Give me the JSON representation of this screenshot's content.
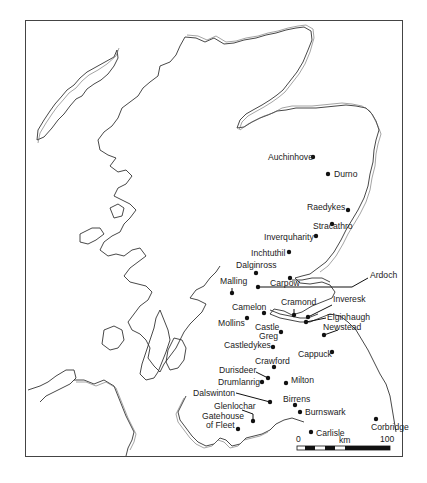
{
  "map": {
    "title": "",
    "region": "Scotland and northern England",
    "sites": [
      {
        "name": "Auchinhove",
        "x": 313,
        "y": 157,
        "lx": 268,
        "ly": 160,
        "anchor": "start"
      },
      {
        "name": "Durno",
        "x": 328,
        "y": 174,
        "lx": 334,
        "ly": 177,
        "anchor": "start"
      },
      {
        "name": "Raedykes",
        "x": 348,
        "y": 210,
        "lx": 307,
        "ly": 210,
        "anchor": "start"
      },
      {
        "name": "Stracathro",
        "x": 332,
        "y": 224,
        "lx": 313,
        "ly": 229,
        "anchor": "start"
      },
      {
        "name": "Inverquharity",
        "x": 316,
        "y": 236,
        "lx": 264,
        "ly": 240,
        "anchor": "start"
      },
      {
        "name": "Inchtuthil",
        "x": 289,
        "y": 252,
        "lx": 251,
        "ly": 256,
        "anchor": "start"
      },
      {
        "name": "Dalginross",
        "x": 256,
        "y": 273,
        "lx": 236,
        "ly": 268,
        "anchor": "start"
      },
      {
        "name": "Carpow",
        "x": 290,
        "y": 278,
        "lx": 270,
        "ly": 286,
        "anchor": "start"
      },
      {
        "name": "Malling",
        "x": 232,
        "y": 293,
        "lx": 220,
        "ly": 284,
        "anchor": "start"
      },
      {
        "name": "Ardoch",
        "x": 258,
        "y": 287,
        "lx": 370,
        "ly": 278,
        "anchor": "start"
      },
      {
        "name": "Cramond",
        "x": 294,
        "y": 315,
        "lx": 281,
        "ly": 305,
        "anchor": "start"
      },
      {
        "name": "Inveresk",
        "x": 308,
        "y": 317,
        "lx": 333,
        "ly": 302,
        "anchor": "start"
      },
      {
        "name": "Camelon",
        "x": 264,
        "y": 313,
        "lx": 232,
        "ly": 310,
        "anchor": "start"
      },
      {
        "name": "Elginhaugh",
        "x": 306,
        "y": 322,
        "lx": 327,
        "ly": 320,
        "anchor": "start"
      },
      {
        "name": "Mollins",
        "x": 247,
        "y": 318,
        "lx": 218,
        "ly": 326,
        "anchor": "start"
      },
      {
        "name": "Newstead",
        "x": 324,
        "y": 335,
        "lx": 323,
        "ly": 330,
        "anchor": "start"
      },
      {
        "name": "Castle Greg",
        "x": 281,
        "y": 332,
        "lx": 255,
        "ly": 330,
        "anchor": "start"
      },
      {
        "name": "Castledykes",
        "x": 273,
        "y": 347,
        "lx": 224,
        "ly": 348,
        "anchor": "start"
      },
      {
        "name": "Cappuck",
        "x": 332,
        "y": 352,
        "lx": 298,
        "ly": 357,
        "anchor": "start"
      },
      {
        "name": "Crawford",
        "x": 274,
        "y": 367,
        "lx": 255,
        "ly": 364,
        "anchor": "start"
      },
      {
        "name": "Durisdeer",
        "x": 268,
        "y": 378,
        "lx": 219,
        "ly": 373,
        "anchor": "start"
      },
      {
        "name": "Drumlanrig",
        "x": 262,
        "y": 382,
        "lx": 218,
        "ly": 385,
        "anchor": "start"
      },
      {
        "name": "Milton",
        "x": 286,
        "y": 383,
        "lx": 291,
        "ly": 383,
        "anchor": "start"
      },
      {
        "name": "Dalswinton",
        "x": 270,
        "y": 402,
        "lx": 193,
        "ly": 396,
        "anchor": "start"
      },
      {
        "name": "Birrens",
        "x": 295,
        "y": 405,
        "lx": 283,
        "ly": 402,
        "anchor": "start"
      },
      {
        "name": "Burnswark",
        "x": 300,
        "y": 412,
        "lx": 305,
        "ly": 415,
        "anchor": "start"
      },
      {
        "name": "Glenlochar",
        "x": 253,
        "y": 421,
        "lx": 214,
        "ly": 409,
        "anchor": "start"
      },
      {
        "name": "Gatehouse of Fleet",
        "x": 238,
        "y": 429,
        "lx": 202,
        "ly": 419,
        "anchor": "start"
      },
      {
        "name": "Corbridge",
        "x": 376,
        "y": 419,
        "lx": 371,
        "ly": 430,
        "anchor": "start"
      },
      {
        "name": "Carlisle",
        "x": 311,
        "y": 432,
        "lx": 316,
        "ly": 436,
        "anchor": "start"
      }
    ],
    "scale_bar": {
      "start_label": "0",
      "unit_label": "km",
      "end_label": "100"
    }
  }
}
